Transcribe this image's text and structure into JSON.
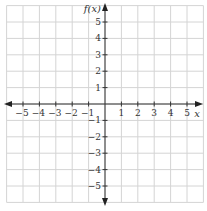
{
  "diagram": {
    "type": "coordinate-grid",
    "x_axis": {
      "label": "x",
      "min": -6,
      "max": 6,
      "tick_labels": [
        "−5",
        "−4",
        "−3",
        "−2",
        "−1",
        "1",
        "2",
        "3",
        "4",
        "5"
      ],
      "tick_values": [
        -5,
        -4,
        -3,
        -2,
        -1,
        1,
        2,
        3,
        4,
        5
      ]
    },
    "y_axis": {
      "label": "f(x)",
      "min": -6,
      "max": 6,
      "tick_labels": [
        "5",
        "4",
        "3",
        "2",
        "1",
        "−1",
        "−2",
        "−3",
        "−4",
        "−5"
      ],
      "tick_values": [
        5,
        4,
        3,
        2,
        1,
        -1,
        -2,
        -3,
        -4,
        -5
      ]
    },
    "grid": true,
    "colors": {
      "grid": "#d4d4d4",
      "axis": "#333333",
      "background": "#ffffff"
    }
  }
}
